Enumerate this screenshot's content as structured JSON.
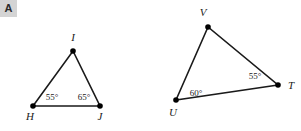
{
  "badge": {
    "label": "A",
    "background": "#d4d4d4",
    "text_color": "#2b2b2b"
  },
  "canvas": {
    "width": 301,
    "height": 131,
    "background": "#ffffff",
    "stroke_color": "#1a1a1a",
    "vertex_dot_color": "#000000"
  },
  "figures": [
    {
      "name": "triangle-hij",
      "vertices": [
        {
          "id": "H",
          "label": "H",
          "x": 33,
          "y": 106,
          "label_x": 30,
          "label_y": 120
        },
        {
          "id": "I",
          "label": "I",
          "x": 73,
          "y": 51,
          "label_x": 73,
          "label_y": 41
        },
        {
          "id": "J",
          "label": "J",
          "x": 100,
          "y": 106,
          "label_x": 100,
          "label_y": 120
        }
      ],
      "angles": [
        {
          "at": "H",
          "value": "55°",
          "label_x": 52,
          "label_y": 100
        },
        {
          "at": "J",
          "value": "65°",
          "label_x": 84,
          "label_y": 100
        }
      ]
    },
    {
      "name": "triangle-uvt",
      "vertices": [
        {
          "id": "U",
          "label": "U",
          "x": 176,
          "y": 100,
          "label_x": 173,
          "label_y": 116
        },
        {
          "id": "V",
          "label": "V",
          "x": 208,
          "y": 27,
          "label_x": 203,
          "label_y": 16
        },
        {
          "id": "T",
          "label": "T",
          "x": 278,
          "y": 85,
          "label_x": 291,
          "label_y": 89
        }
      ],
      "angles": [
        {
          "at": "U",
          "value": "60°",
          "label_x": 196,
          "label_y": 96
        },
        {
          "at": "T",
          "value": "55°",
          "label_x": 255,
          "label_y": 79
        }
      ]
    }
  ]
}
